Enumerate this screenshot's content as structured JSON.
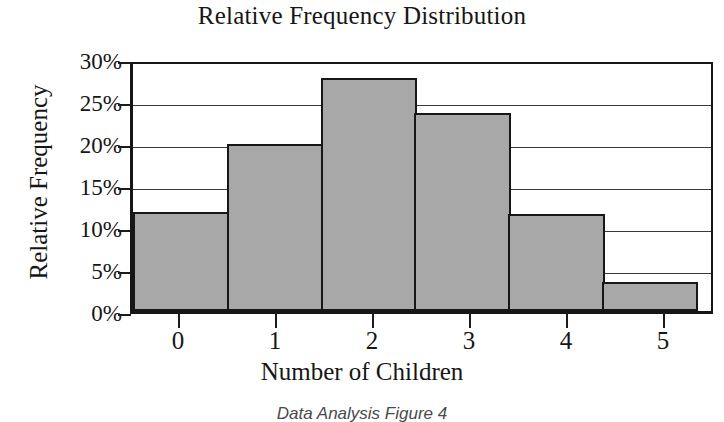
{
  "chart_data": {
    "type": "bar",
    "title": "Relative Frequency Distribution",
    "xlabel": "Number of Children",
    "ylabel": "Relative Frequency",
    "categories": [
      "0",
      "1",
      "2",
      "3",
      "4",
      "5"
    ],
    "values": [
      11.8,
      19.9,
      27.7,
      23.6,
      11.5,
      3.5
    ],
    "value_unit": "%",
    "ylim": [
      0,
      30
    ],
    "ytick_labels": [
      "30%",
      "25%",
      "20%",
      "15%",
      "10%",
      "5%",
      "0%"
    ],
    "ytick_values": [
      30,
      25,
      20,
      15,
      10,
      5,
      0
    ],
    "grid": true,
    "grid_axis": "y",
    "legend": false,
    "bar_fill_color": "#a8a8a8",
    "bar_edge_color": "#171717",
    "axis_color": "#161616",
    "background_color": "#ffffff",
    "bars_touch": true
  },
  "caption": "Data Analysis Figure 4"
}
